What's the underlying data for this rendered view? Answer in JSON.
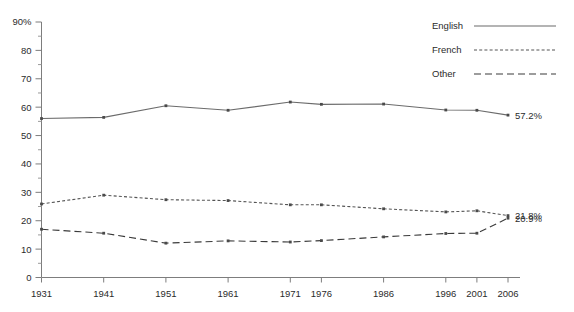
{
  "chart_data": {
    "type": "line",
    "title": "",
    "subtitle": "",
    "xlabel": "",
    "ylabel": "",
    "x": [
      "1931",
      "1941",
      "1951",
      "1961",
      "1971",
      "1976",
      "1986",
      "1996",
      "2001",
      "2006"
    ],
    "x_numeric": [
      1931,
      1941,
      1951,
      1961,
      1971,
      1976,
      1986,
      1996,
      2001,
      2006
    ],
    "xlim": [
      1931,
      2006
    ],
    "ylim": [
      0,
      90
    ],
    "y_ticks": [
      "0",
      "10",
      "20",
      "30",
      "40",
      "50",
      "60",
      "70",
      "80",
      "90%"
    ],
    "y_tick_values": [
      0,
      10,
      20,
      30,
      40,
      50,
      60,
      70,
      80,
      90
    ],
    "y_minor_ticks": [
      5,
      15,
      25,
      35,
      45,
      55,
      65,
      75,
      85
    ],
    "grid": false,
    "legend_position": "top-right",
    "series": [
      {
        "name": "English",
        "style": "solid",
        "color": "#6b6b6b",
        "values": [
          56.0,
          56.4,
          60.5,
          58.9,
          61.8,
          61.0,
          61.1,
          59.0,
          58.9,
          57.2
        ],
        "end_label": "57.2%"
      },
      {
        "name": "French",
        "style": "dotted",
        "color": "#555555",
        "values": [
          25.9,
          29.0,
          27.4,
          27.1,
          25.6,
          25.6,
          24.2,
          23.1,
          23.5,
          21.8
        ],
        "end_label": "21.8%"
      },
      {
        "name": "Other",
        "style": "dashed",
        "color": "#3a3a3a",
        "values": [
          17.0,
          15.6,
          12.1,
          12.9,
          12.5,
          13.0,
          14.3,
          15.5,
          15.6,
          20.9
        ],
        "end_label": "20.9%"
      }
    ]
  },
  "legend": {
    "items": [
      {
        "label": "English"
      },
      {
        "label": "French"
      },
      {
        "label": "Other"
      }
    ]
  },
  "value_labels": [
    {
      "text": "57.2%"
    },
    {
      "text": "21.8%"
    },
    {
      "text": "20.9%"
    }
  ]
}
